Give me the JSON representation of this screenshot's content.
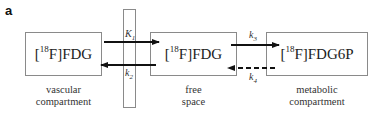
{
  "panel": {
    "label": "a"
  },
  "compartments": [
    {
      "name": "vascular",
      "species_prefix": "[",
      "isotope": "18",
      "species_suffix": "F]FDG",
      "caption_line1": "vascular",
      "caption_line2": "compartment"
    },
    {
      "name": "free",
      "species_prefix": "[",
      "isotope": "18",
      "species_suffix": "F]FDG",
      "caption_line1": "free",
      "caption_line2": "space"
    },
    {
      "name": "metabolic",
      "species_prefix": "[",
      "isotope": "18",
      "species_suffix": "F]FDG6P",
      "caption_line1": "metabolic",
      "caption_line2": "compartment"
    }
  ],
  "rates": {
    "K1": {
      "base": "K",
      "sub": "1",
      "direction": "vascular→free",
      "style": "solid"
    },
    "k2": {
      "base": "k",
      "sub": "2",
      "direction": "free→vascular",
      "style": "solid"
    },
    "k3": {
      "base": "k",
      "sub": "3",
      "direction": "free→metabolic",
      "style": "solid"
    },
    "k4": {
      "base": "k",
      "sub": "4",
      "direction": "metabolic→free",
      "style": "dashed"
    }
  },
  "colors": {
    "box_border": "#8a8a8a",
    "arrow": "#111111",
    "text": "#222222"
  }
}
